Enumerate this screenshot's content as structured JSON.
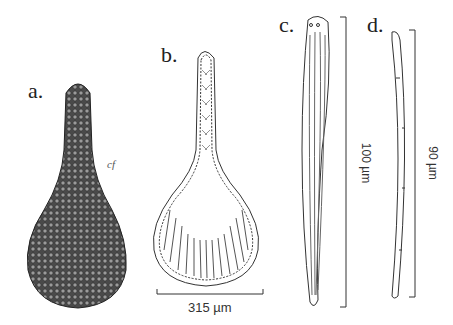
{
  "figure": {
    "panels": [
      {
        "label": "a.",
        "description": "Sponge-like clavate body covered in cells, external view"
      },
      {
        "label": "b.",
        "description": "Longitudinal section of clavate body showing choanocyte chambers"
      },
      {
        "label": "c.",
        "description": "Elongate spicule-like structure"
      },
      {
        "label": "d.",
        "description": "Slender curved spicule"
      }
    ],
    "annotation_a": "cf",
    "scale_bars": {
      "b": "315 µm",
      "c": "100 µm",
      "d": "90 µm"
    }
  }
}
